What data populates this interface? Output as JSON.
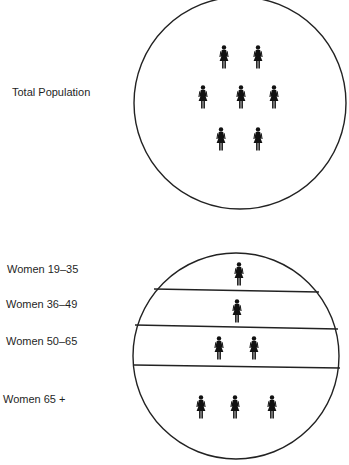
{
  "diagram": {
    "top_panel": {
      "label": "Total Population",
      "figure_count": 7,
      "icon": "woman-figure-icon"
    },
    "bottom_panel": {
      "bands": [
        {
          "label": "Women 19–35",
          "figure_count": 1
        },
        {
          "label": "Women 36–49",
          "figure_count": 1
        },
        {
          "label": "Women 50–65",
          "figure_count": 2
        },
        {
          "label": "Women 65 +",
          "figure_count": 3
        }
      ],
      "icon": "woman-figure-icon"
    },
    "colors": {
      "stroke": "#222222",
      "figure": "#111111",
      "background": "#ffffff"
    }
  }
}
